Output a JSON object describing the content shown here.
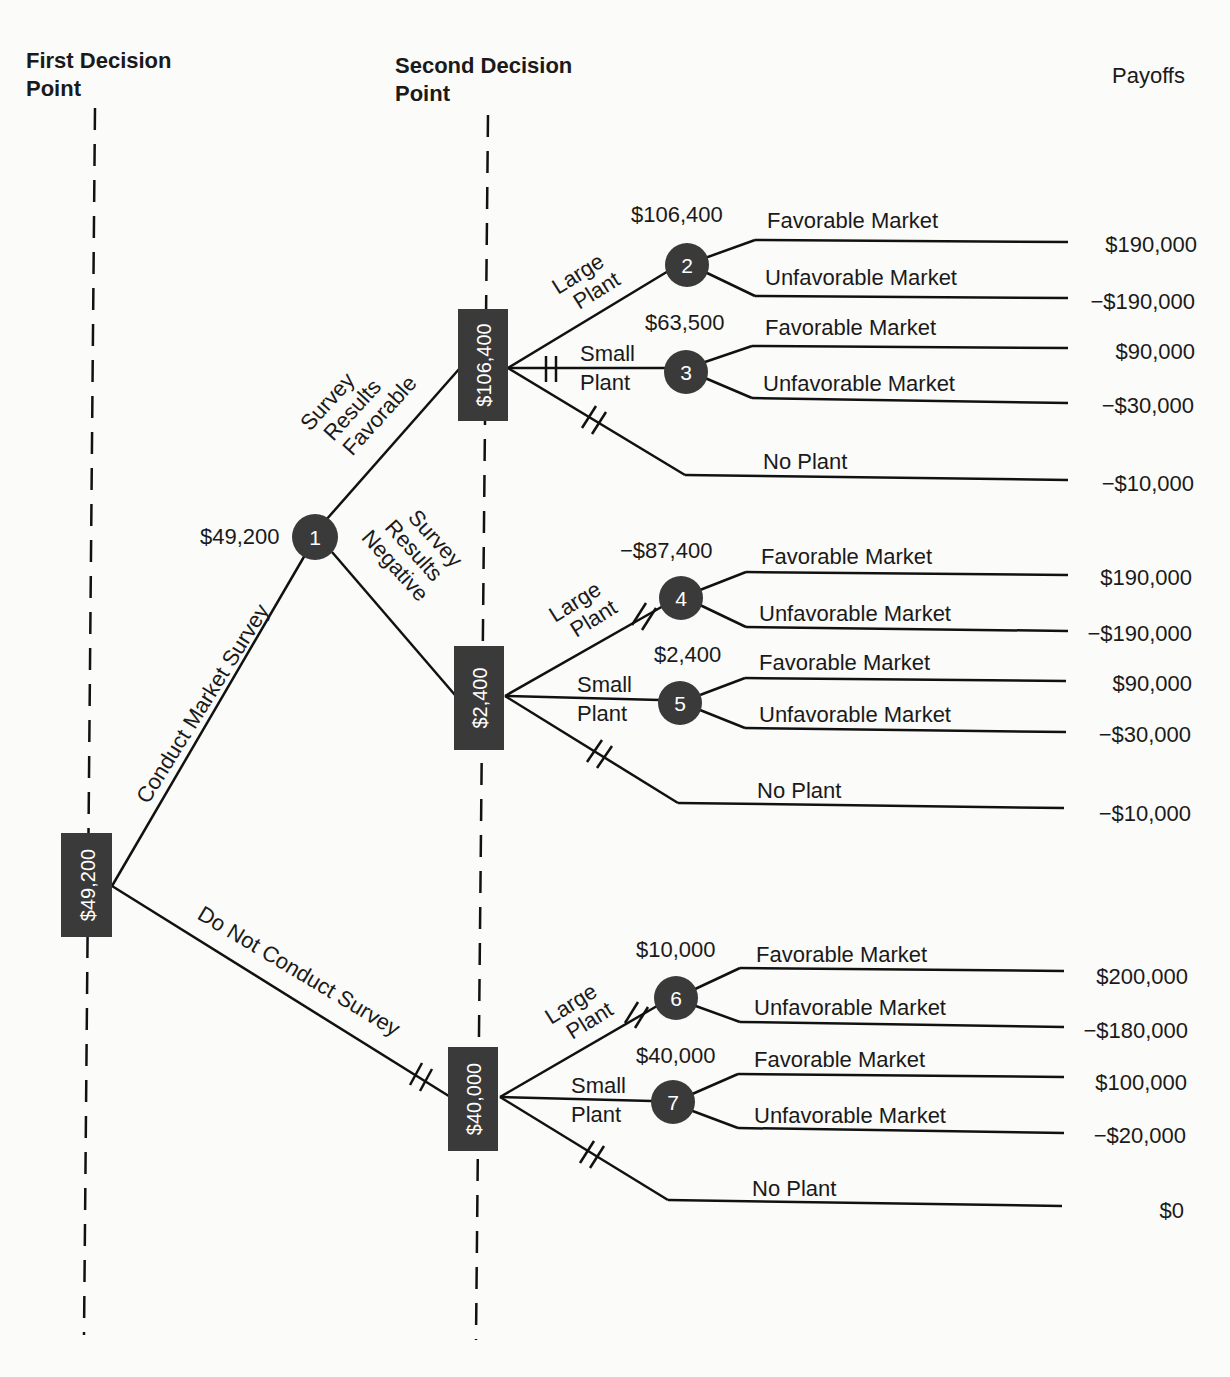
{
  "headers": {
    "first_decision_point": [
      "First Decision",
      "Point"
    ],
    "second_decision_point": [
      "Second Decision",
      "Point"
    ],
    "payoffs": "Payoffs"
  },
  "root": {
    "value": "$49,200",
    "branches": {
      "survey": "Conduct Market Survey",
      "no_survey": "Do Not Conduct Survey"
    }
  },
  "chance1": {
    "id": "1",
    "value": "$49,200",
    "branches": {
      "favorable": [
        "Survey",
        "Results",
        "Favorable"
      ],
      "negative": [
        "Survey",
        "Results",
        "Negative"
      ]
    }
  },
  "decisions": [
    {
      "value": "$106,400",
      "options": [
        {
          "label": [
            "Large",
            "Plant"
          ],
          "node": "2",
          "ev": "$106,400",
          "outcomes": [
            {
              "label": "Favorable Market",
              "payoff": "$190,000"
            },
            {
              "label": "Unfavorable Market",
              "payoff": "−$190,000"
            }
          ]
        },
        {
          "label": [
            "Small",
            "Plant"
          ],
          "node": "3",
          "ev": "$63,500",
          "outcomes": [
            {
              "label": "Favorable Market",
              "payoff": "$90,000"
            },
            {
              "label": "Unfavorable Market",
              "payoff": "−$30,000"
            }
          ]
        },
        {
          "label": "No Plant",
          "payoff": "−$10,000"
        }
      ]
    },
    {
      "value": "$2,400",
      "options": [
        {
          "label": [
            "Large",
            "Plant"
          ],
          "node": "4",
          "ev": "−$87,400",
          "outcomes": [
            {
              "label": "Favorable Market",
              "payoff": "$190,000"
            },
            {
              "label": "Unfavorable Market",
              "payoff": "−$190,000"
            }
          ]
        },
        {
          "label": [
            "Small",
            "Plant"
          ],
          "node": "5",
          "ev": "$2,400",
          "outcomes": [
            {
              "label": "Favorable Market",
              "payoff": "$90,000"
            },
            {
              "label": "Unfavorable Market",
              "payoff": "−$30,000"
            }
          ]
        },
        {
          "label": "No Plant",
          "payoff": "−$10,000"
        }
      ]
    },
    {
      "value": "$40,000",
      "options": [
        {
          "label": [
            "Large",
            "Plant"
          ],
          "node": "6",
          "ev": "$10,000",
          "outcomes": [
            {
              "label": "Favorable Market",
              "payoff": "$200,000"
            },
            {
              "label": "Unfavorable Market",
              "payoff": "−$180,000"
            }
          ]
        },
        {
          "label": [
            "Small",
            "Plant"
          ],
          "node": "7",
          "ev": "$40,000",
          "outcomes": [
            {
              "label": "Favorable Market",
              "payoff": "$100,000"
            },
            {
              "label": "Unfavorable Market",
              "payoff": "−$20,000"
            }
          ]
        },
        {
          "label": "No Plant",
          "payoff": "$0"
        }
      ]
    }
  ],
  "colors": {
    "node_fill": "#3a3a3a",
    "line": "#111111",
    "background": "#fbfbf9"
  }
}
